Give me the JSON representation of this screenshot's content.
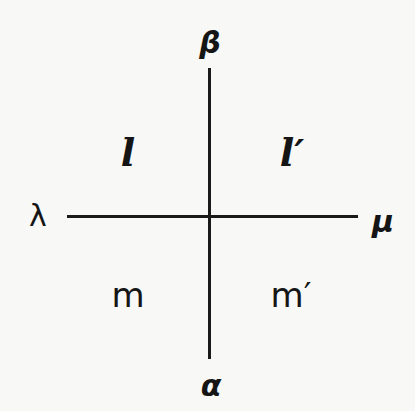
{
  "diagram": {
    "type": "cross-lines",
    "vertical_line": {
      "top_label": "β",
      "bottom_label": "α"
    },
    "horizontal_line": {
      "left_label": "λ",
      "right_label": "μ"
    },
    "quadrants": {
      "top_left": "l",
      "top_right": "l′",
      "bottom_left": "m",
      "bottom_right": "m′"
    },
    "colors": {
      "ink": "#1a1a1a",
      "background": "#f8f8f6"
    }
  }
}
